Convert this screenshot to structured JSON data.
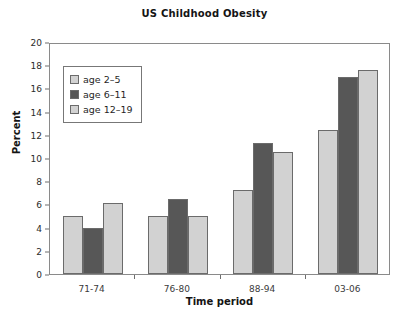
{
  "chart_data": {
    "type": "bar",
    "title": "US Childhood Obesity",
    "xlabel": "Time period",
    "ylabel": "Percent",
    "categories": [
      "71-74",
      "76-80",
      "88-94",
      "03-06"
    ],
    "series": [
      {
        "name": "age 2–5",
        "color": "#d2d2d2",
        "values": [
          5.0,
          5.0,
          7.2,
          12.4
        ]
      },
      {
        "name": "age 6–11",
        "color": "#575757",
        "values": [
          4.0,
          6.5,
          11.3,
          17.0
        ]
      },
      {
        "name": "age 12–19",
        "color": "#d2d2d2",
        "values": [
          6.1,
          5.0,
          10.5,
          17.6
        ]
      }
    ],
    "ylim": [
      0,
      20
    ],
    "yticks": [
      0,
      2,
      4,
      6,
      8,
      10,
      12,
      14,
      16,
      18,
      20
    ],
    "ytick_labels": [
      "0",
      "2",
      "4",
      "6",
      "8",
      "10",
      "12",
      "14",
      "16",
      "18",
      "20"
    ],
    "grid": false,
    "legend_position": "upper left",
    "bar_edge_color": "#6b6b6b",
    "frame_color": "#8a8a8a"
  }
}
